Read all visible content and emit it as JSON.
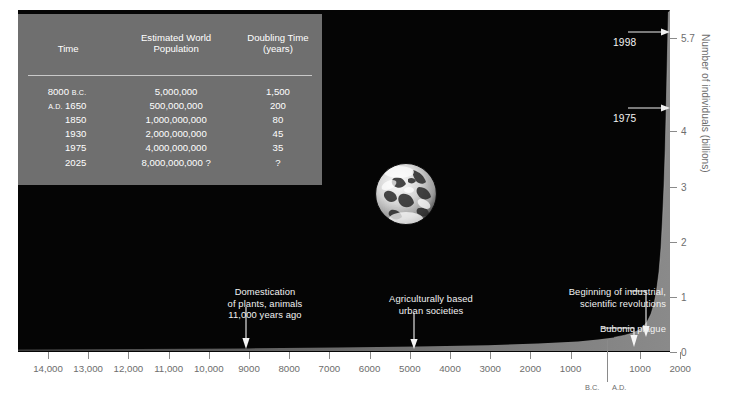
{
  "chart_data": {
    "type": "area",
    "title": "",
    "xlabel": "",
    "ylabel": "Number of individuals (billions)",
    "ylim": [
      0,
      6.2
    ],
    "y_ticks": [
      "0",
      "1",
      "2",
      "3",
      "4",
      "5.7"
    ],
    "y_tick_values": [
      0,
      1,
      2,
      3,
      4,
      5.7
    ],
    "x_ticks_bc": [
      "14,000",
      "13,000",
      "12,000",
      "11,000",
      "10,000",
      "9000",
      "8000",
      "7000",
      "6000",
      "5000",
      "4000",
      "3000",
      "2000",
      "1000"
    ],
    "x_ticks_ad": [
      "1000",
      "2000"
    ],
    "era_labels": {
      "bc": "B.C.",
      "ad": "A.D."
    },
    "grid": false,
    "legend": false,
    "series": [
      {
        "name": "World population",
        "x": [
          -14000,
          -11000,
          -9000,
          -8000,
          -6000,
          -4000,
          -2000,
          -1000,
          0,
          500,
          1000,
          1350,
          1400,
          1500,
          1650,
          1750,
          1850,
          1900,
          1930,
          1950,
          1975,
          1998,
          2000
        ],
        "values": [
          0.004,
          0.005,
          0.005,
          0.005,
          0.01,
          0.03,
          0.05,
          0.1,
          0.2,
          0.21,
          0.3,
          0.37,
          0.32,
          0.45,
          0.5,
          0.79,
          1.0,
          1.65,
          2.0,
          2.5,
          4.0,
          5.7,
          6.0
        ]
      }
    ],
    "annotations": [
      {
        "name": "domestication",
        "text": "Domestication\nof plants, animals\n11,000 years ago",
        "x_label": "9000 B.C."
      },
      {
        "name": "agricultural",
        "text": "Agriculturally based\nurban societies",
        "x_label": "5000 B.C."
      },
      {
        "name": "industrial",
        "text": "Beginning of industrial,\nscientific revolutions",
        "x_label": "1750 A.D."
      },
      {
        "name": "plague",
        "text": "Bubonic plague",
        "x_label": "1350 A.D."
      },
      {
        "name": "year-1998",
        "text": "1998",
        "value": "5.7"
      },
      {
        "name": "year-1975",
        "text": "1975",
        "value": "4"
      }
    ]
  },
  "table": {
    "headers": {
      "time": "Time",
      "population_line1": "Estimated World",
      "population_line2": "Population",
      "doubling_line1": "Doubling Time",
      "doubling_line2": "(years)"
    },
    "rows": [
      {
        "time": "8000",
        "era": "B.C.",
        "era_position": "after",
        "population": "5,000,000",
        "doubling": "1,500"
      },
      {
        "time": "1650",
        "era": "A.D.",
        "era_position": "before",
        "population": "500,000,000",
        "doubling": "200"
      },
      {
        "time": "1850",
        "era": "",
        "era_position": "",
        "population": "1,000,000,000",
        "doubling": "80"
      },
      {
        "time": "1930",
        "era": "",
        "era_position": "",
        "population": "2,000,000,000",
        "doubling": "45"
      },
      {
        "time": "1975",
        "era": "",
        "era_position": "",
        "population": "4,000,000,000",
        "doubling": "35"
      },
      {
        "time": "2025",
        "era": "",
        "era_position": "",
        "population": "8,000,000,000 ?",
        "doubling": "?"
      }
    ]
  },
  "colors": {
    "plot_background": "#050505",
    "curve_fill": "#8c8c8c",
    "table_background": "#6f6f6f",
    "axis_text": "#6d6d6d",
    "annotation_text": "#f2f2f2"
  },
  "earth": {
    "name": "earth-photograph",
    "caption": ""
  }
}
